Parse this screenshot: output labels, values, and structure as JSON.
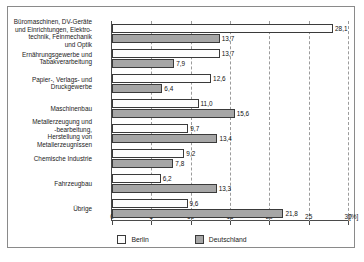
{
  "chart_data": {
    "type": "bar",
    "orientation": "horizontal",
    "title": "",
    "subtitle": "",
    "xlabel": "[%]",
    "ylabel": "",
    "xlim": [
      0,
      30
    ],
    "xticks": [
      "0",
      "5",
      "10",
      "15",
      "20",
      "25",
      "30"
    ],
    "xtick_values": [
      0,
      5,
      10,
      15,
      20,
      25,
      30
    ],
    "grid": "vertical-dashed",
    "legend_position": "bottom-center",
    "categories": [
      "Büromaschinen, DV-Geräte\nund Einrichtungen, Elektro-\ntechnik, Feinmechanik\nund Optik",
      "Ernährungsgewerbe und\nTabakverarbeitung",
      "Papier-, Verlags- und\nDruckgewerbe",
      "Maschinenbau",
      "Metallerzeugung und\n-bearbeitung,\nHerstellung von\nMetallerzeugnissen",
      "Chemische Industrie",
      "Fahrzeugbau",
      "Übrige"
    ],
    "series": [
      {
        "name": "Berlin",
        "color": "#fdfdfd",
        "values": [
          28.1,
          13.7,
          12.6,
          11.0,
          9.7,
          9.2,
          6.2,
          9.6
        ],
        "labels": [
          "28,1",
          "13,7",
          "12,6",
          "11,0",
          "9,7",
          "9,2",
          "6,2",
          "9,6"
        ]
      },
      {
        "name": "Deutschland",
        "color": "#a6a6a6",
        "values": [
          13.7,
          7.9,
          6.4,
          15.6,
          13.4,
          7.8,
          13.3,
          21.8
        ],
        "labels": [
          "13,7",
          "7,9",
          "6,4",
          "15,6",
          "13,4",
          "7,8",
          "13,3",
          "21,8"
        ]
      }
    ]
  },
  "legend": {
    "items": [
      {
        "label": "Berlin"
      },
      {
        "label": "Deutschland"
      }
    ]
  },
  "axis": {
    "unit_label": "[%]"
  }
}
